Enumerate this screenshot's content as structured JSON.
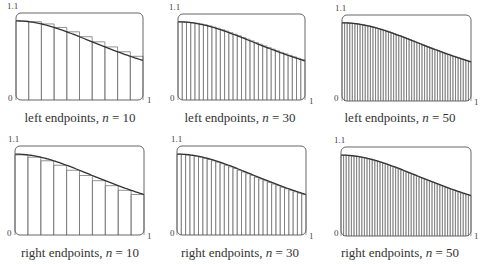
{
  "chart_data": [
    {
      "type": "bar",
      "title": "left endpoints, n = 10",
      "method": "left",
      "n": 10,
      "function": "1/(1+x^2)",
      "xlim": [
        0,
        1
      ],
      "ylim": [
        0,
        1.1
      ],
      "tick_labels": {
        "y_top": "1.1",
        "y_bottom": "0",
        "x_right": "1"
      },
      "grid": false
    },
    {
      "type": "bar",
      "title": "left endpoints, n = 30",
      "method": "left",
      "n": 30,
      "function": "1/(1+x^2)",
      "xlim": [
        0,
        1
      ],
      "ylim": [
        0,
        1.1
      ],
      "tick_labels": {
        "y_top": "1.1",
        "y_bottom": "0",
        "x_right": "1"
      },
      "grid": false
    },
    {
      "type": "bar",
      "title": "left endpoints, n = 50",
      "method": "left",
      "n": 50,
      "function": "1/(1+x^2)",
      "xlim": [
        0,
        1
      ],
      "ylim": [
        0,
        1.1
      ],
      "tick_labels": {
        "y_top": "1.1",
        "y_bottom": "0",
        "x_right": "1"
      },
      "grid": false
    },
    {
      "type": "bar",
      "title": "right endpoints, n = 10",
      "method": "right",
      "n": 10,
      "function": "1/(1+x^2)",
      "xlim": [
        0,
        1
      ],
      "ylim": [
        0,
        1.1
      ],
      "tick_labels": {
        "y_top": "1.1",
        "y_bottom": "0",
        "x_right": "1"
      },
      "grid": false
    },
    {
      "type": "bar",
      "title": "right endpoints, n = 30",
      "method": "right",
      "n": 30,
      "function": "1/(1+x^2)",
      "xlim": [
        0,
        1
      ],
      "ylim": [
        0,
        1.1
      ],
      "tick_labels": {
        "y_top": "1.1",
        "y_bottom": "0",
        "x_right": "1"
      },
      "grid": false
    },
    {
      "type": "bar",
      "title": "right endpoints, n = 50",
      "method": "right",
      "n": 50,
      "function": "1/(1+x^2)",
      "xlim": [
        0,
        1
      ],
      "ylim": [
        0,
        1.1
      ],
      "tick_labels": {
        "y_top": "1.1",
        "y_bottom": "0",
        "x_right": "1"
      },
      "grid": false
    }
  ],
  "panels": [
    {
      "caption_prefix": "left endpoints, ",
      "caption_var": "n",
      "caption_suffix": " = 10",
      "y_top": "1.1",
      "y_bottom": "0",
      "x_right": "1"
    },
    {
      "caption_prefix": "left endpoints, ",
      "caption_var": "n",
      "caption_suffix": " = 30",
      "y_top": "1.1",
      "y_bottom": "0",
      "x_right": "1"
    },
    {
      "caption_prefix": "left endpoints, ",
      "caption_var": "n",
      "caption_suffix": " = 50",
      "y_top": "1.1",
      "y_bottom": "0",
      "x_right": "1"
    },
    {
      "caption_prefix": "right endpoints, ",
      "caption_var": "n",
      "caption_suffix": " = 10",
      "y_top": "1.1",
      "y_bottom": "0",
      "x_right": "1"
    },
    {
      "caption_prefix": "right endpoints, ",
      "caption_var": "n",
      "caption_suffix": " = 30",
      "y_top": "1.1",
      "y_bottom": "0",
      "x_right": "1"
    },
    {
      "caption_prefix": "right endpoints, ",
      "caption_var": "n",
      "caption_suffix": " = 50",
      "y_top": "1.1",
      "y_bottom": "0",
      "x_right": "1"
    }
  ],
  "colors": {
    "frame": "#555555",
    "bars": "#777777",
    "curve": "#333333",
    "text": "#333333"
  }
}
